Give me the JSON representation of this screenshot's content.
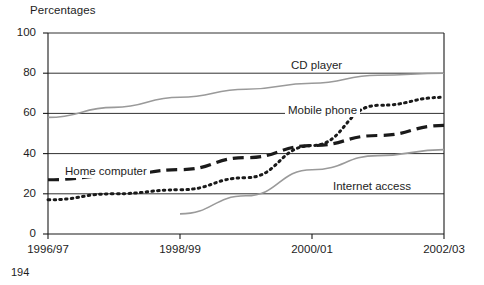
{
  "page_number": "194",
  "chart_data": {
    "type": "line",
    "title": "",
    "ylabel": "Percentages",
    "xlabel": "",
    "ylim": [
      0,
      100
    ],
    "yticks": [
      0,
      20,
      40,
      60,
      80,
      100
    ],
    "grid": true,
    "legend_position": "inline-labels",
    "categories": [
      "1996/97",
      "1997/98",
      "1998/99",
      "1999/00",
      "2000/01",
      "2001/02",
      "2002/03"
    ],
    "xtick_labels": [
      "1996/97",
      "1998/99",
      "2000/01",
      "2002/03"
    ],
    "series": [
      {
        "name": "CD player",
        "style": "solid",
        "color": "#9a9a9a",
        "label_x": "2002/03",
        "values": [
          58,
          63,
          68,
          72,
          75,
          79,
          80
        ]
      },
      {
        "name": "Mobile phone",
        "style": "dotted",
        "color": "#1a1a1a",
        "values": [
          17,
          20,
          22,
          28,
          44,
          64,
          68
        ]
      },
      {
        "name": "Home computer",
        "style": "dashed",
        "color": "#1a1a1a",
        "values": [
          27,
          29,
          32,
          38,
          44,
          49,
          54
        ]
      },
      {
        "name": "Internet access",
        "style": "solid",
        "color": "#9a9a9a",
        "values": [
          null,
          null,
          10,
          19,
          32,
          39,
          42
        ]
      }
    ],
    "annotations": [
      {
        "text": "CD player",
        "x": 288,
        "y": 59
      },
      {
        "text": "Mobile phone",
        "x": 285,
        "y": 104
      },
      {
        "text": "Home computer",
        "x": 62,
        "y": 165
      },
      {
        "text": "Internet access",
        "x": 330,
        "y": 180
      }
    ]
  }
}
